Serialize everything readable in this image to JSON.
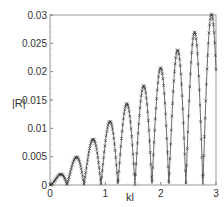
{
  "chart_data": {
    "type": "line",
    "title": "",
    "xlabel": "kl",
    "ylabel": "|R|",
    "xlim": [
      0,
      3
    ],
    "ylim": [
      0,
      0.03
    ],
    "xticks": [
      "0",
      "1",
      "2",
      "3"
    ],
    "yticks": [
      "0",
      "0.005",
      "0.01",
      "0.015",
      "0.02",
      "0.025",
      "0.03"
    ],
    "grid": false,
    "legend": null,
    "series": [
      {
        "name": "|R| (line with x markers)",
        "marker": "x",
        "peaks_x": [
          0.18,
          0.48,
          0.77,
          1.07,
          1.37,
          1.67,
          1.97,
          2.27,
          2.57,
          2.87
        ],
        "peaks_y": [
          0.0017,
          0.0047,
          0.0079,
          0.011,
          0.014,
          0.0172,
          0.0202,
          0.0233,
          0.0265,
          0.0296
        ],
        "zeros_x": [
          0.0,
          0.31,
          0.62,
          0.93,
          1.22,
          1.53,
          1.84,
          2.15,
          2.45,
          2.75
        ],
        "end_point": [
          3.0,
          0.015
        ],
        "period": 0.307
      }
    ]
  },
  "axes": {
    "xlabel": "kl",
    "ylabel": "|R|"
  }
}
